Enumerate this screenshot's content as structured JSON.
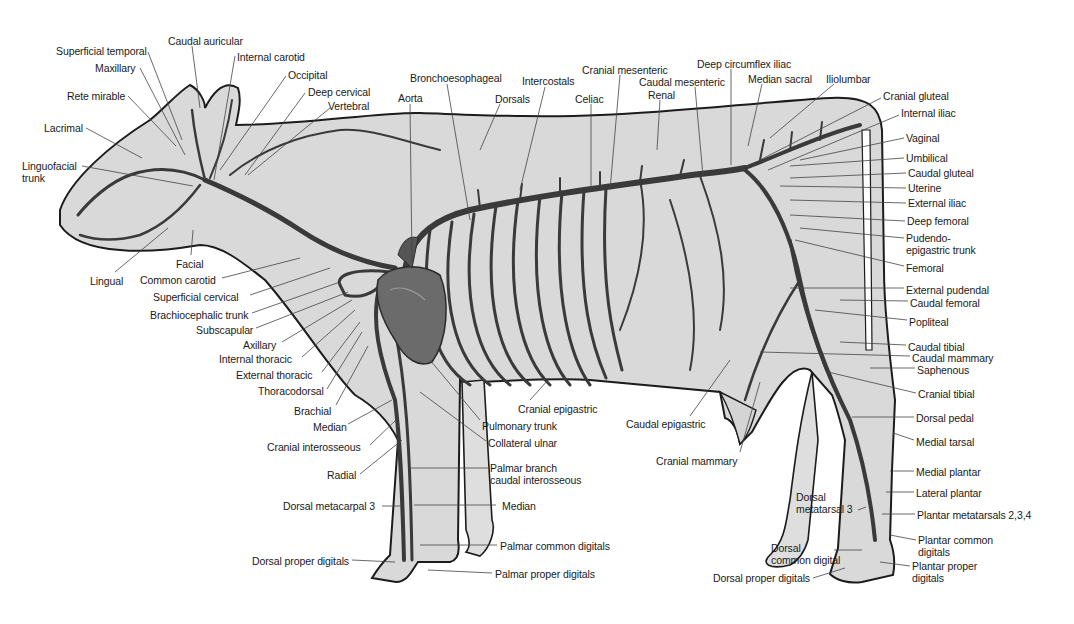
{
  "figure": {
    "colors": {
      "background": "#ffffff",
      "body_fill": "#d9d9d9",
      "outline": "#1c1c1c",
      "artery": "#3a3a3a",
      "leader": "#444444",
      "text": "#1a1a1a",
      "heart": "#6b6b6b"
    }
  },
  "labels": {
    "head": [
      {
        "text": "Superficial temporal",
        "x": 56,
        "y": 45,
        "align": "left",
        "lx1": 148,
        "ly1": 52,
        "lx2": 182,
        "ly2": 140
      },
      {
        "text": "Caudal auricular",
        "x": 168,
        "y": 35,
        "align": "left",
        "lx1": 192,
        "ly1": 46,
        "lx2": 200,
        "ly2": 108
      },
      {
        "text": "Internal carotid",
        "x": 237,
        "y": 51,
        "align": "left",
        "lx1": 235,
        "ly1": 56,
        "lx2": 214,
        "ly2": 180
      },
      {
        "text": "Maxillary",
        "x": 95,
        "y": 62,
        "align": "left",
        "lx1": 140,
        "ly1": 68,
        "lx2": 185,
        "ly2": 155
      },
      {
        "text": "Occipital",
        "x": 288,
        "y": 69,
        "align": "left",
        "lx1": 286,
        "ly1": 76,
        "lx2": 220,
        "ly2": 170
      },
      {
        "text": "Rete mirable",
        "x": 67,
        "y": 90,
        "align": "left",
        "lx1": 128,
        "ly1": 96,
        "lx2": 176,
        "ly2": 146
      },
      {
        "text": "Deep cervical",
        "x": 308,
        "y": 86,
        "align": "left",
        "lx1": 305,
        "ly1": 93,
        "lx2": 245,
        "ly2": 175
      },
      {
        "text": "Vertebral",
        "x": 328,
        "y": 100,
        "align": "left",
        "lx1": 330,
        "ly1": 108,
        "lx2": 248,
        "ly2": 175
      },
      {
        "text": "Lacrimal",
        "x": 44,
        "y": 122,
        "align": "left",
        "lx1": 86,
        "ly1": 128,
        "lx2": 142,
        "ly2": 158
      },
      {
        "text": "Linguofacial\ntrunk",
        "x": 22,
        "y": 160,
        "align": "left",
        "lx1": 82,
        "ly1": 166,
        "lx2": 193,
        "ly2": 186
      },
      {
        "text": "Facial",
        "x": 176,
        "y": 258,
        "align": "left",
        "lx1": 191,
        "ly1": 255,
        "lx2": 193,
        "ly2": 230
      },
      {
        "text": "Lingual",
        "x": 90,
        "y": 275,
        "align": "left",
        "lx1": 115,
        "ly1": 272,
        "lx2": 168,
        "ly2": 228
      }
    ],
    "neck_forelimb": [
      {
        "text": "Common carotid",
        "x": 140,
        "y": 274,
        "align": "left",
        "lx1": 222,
        "ly1": 278,
        "lx2": 300,
        "ly2": 258
      },
      {
        "text": "Superficial cervical",
        "x": 153,
        "y": 291,
        "align": "left",
        "lx1": 250,
        "ly1": 295,
        "lx2": 330,
        "ly2": 268
      },
      {
        "text": "Brachiocephalic trunk",
        "x": 150,
        "y": 309,
        "align": "left",
        "lx1": 252,
        "ly1": 313,
        "lx2": 340,
        "ly2": 282
      },
      {
        "text": "Subscapular",
        "x": 196,
        "y": 324,
        "align": "left",
        "lx1": 256,
        "ly1": 328,
        "lx2": 348,
        "ly2": 292
      },
      {
        "text": "Axillary",
        "x": 243,
        "y": 339,
        "align": "left",
        "lx1": 282,
        "ly1": 342,
        "lx2": 352,
        "ly2": 300
      },
      {
        "text": "Internal thoracic",
        "x": 219,
        "y": 353,
        "align": "left",
        "lx1": 302,
        "ly1": 357,
        "lx2": 355,
        "ly2": 310
      },
      {
        "text": "External thoracic",
        "x": 236,
        "y": 369,
        "align": "left",
        "lx1": 322,
        "ly1": 372,
        "lx2": 360,
        "ly2": 322
      },
      {
        "text": "Thoracodorsal",
        "x": 258,
        "y": 385,
        "align": "left",
        "lx1": 327,
        "ly1": 389,
        "lx2": 362,
        "ly2": 332
      },
      {
        "text": "Brachial",
        "x": 294,
        "y": 405,
        "align": "left",
        "lx1": 336,
        "ly1": 405,
        "lx2": 368,
        "ly2": 346
      },
      {
        "text": "Median",
        "x": 313,
        "y": 421,
        "align": "left",
        "lx1": 348,
        "ly1": 424,
        "lx2": 392,
        "ly2": 400
      },
      {
        "text": "Cranial interosseous",
        "x": 267,
        "y": 441,
        "align": "left",
        "lx1": 370,
        "ly1": 445,
        "lx2": 398,
        "ly2": 418
      },
      {
        "text": "Radial",
        "x": 327,
        "y": 469,
        "align": "left",
        "lx1": 360,
        "ly1": 474,
        "lx2": 402,
        "ly2": 440
      },
      {
        "text": "Dorsal metacarpal 3",
        "x": 283,
        "y": 500,
        "align": "left",
        "lx1": 382,
        "ly1": 506,
        "lx2": 404,
        "ly2": 506
      },
      {
        "text": "Dorsal proper digitals",
        "x": 252,
        "y": 555,
        "align": "left",
        "lx1": 352,
        "ly1": 560,
        "lx2": 395,
        "ly2": 562
      }
    ],
    "thorax_top": [
      {
        "text": "Aorta",
        "x": 398,
        "y": 92,
        "align": "left",
        "lx1": 410,
        "ly1": 104,
        "lx2": 412,
        "ly2": 262
      },
      {
        "text": "Bronchoesophageal",
        "x": 410,
        "y": 72,
        "align": "left",
        "lx1": 447,
        "ly1": 84,
        "lx2": 470,
        "ly2": 220
      },
      {
        "text": "Dorsals",
        "x": 495,
        "y": 93,
        "align": "left",
        "lx1": 500,
        "ly1": 104,
        "lx2": 480,
        "ly2": 150
      },
      {
        "text": "Intercostals",
        "x": 522,
        "y": 75,
        "align": "left",
        "lx1": 545,
        "ly1": 87,
        "lx2": 520,
        "ly2": 190
      },
      {
        "text": "Celiac",
        "x": 575,
        "y": 93,
        "align": "left",
        "lx1": 591,
        "ly1": 104,
        "lx2": 591,
        "ly2": 190
      },
      {
        "text": "Cranial mesenteric",
        "x": 582,
        "y": 64,
        "align": "left",
        "lx1": 620,
        "ly1": 75,
        "lx2": 610,
        "ly2": 190
      },
      {
        "text": "Caudal mesenteric",
        "x": 639,
        "y": 76,
        "align": "left",
        "lx1": 695,
        "ly1": 87,
        "lx2": 703,
        "ly2": 176
      },
      {
        "text": "Renal",
        "x": 648,
        "y": 89,
        "align": "left",
        "lx1": 660,
        "ly1": 100,
        "lx2": 657,
        "ly2": 150
      },
      {
        "text": "Deep circumflex iliac",
        "x": 697,
        "y": 58,
        "align": "left",
        "lx1": 731,
        "ly1": 69,
        "lx2": 731,
        "ly2": 165
      },
      {
        "text": "Median sacral",
        "x": 748,
        "y": 73,
        "align": "left",
        "lx1": 762,
        "ly1": 84,
        "lx2": 748,
        "ly2": 146
      },
      {
        "text": "Iliolumbar",
        "x": 826,
        "y": 73,
        "align": "left",
        "lx1": 834,
        "ly1": 84,
        "lx2": 770,
        "ly2": 138
      }
    ],
    "hindquarter_right": [
      {
        "text": "Cranial gluteal",
        "x": 883,
        "y": 90,
        "align": "left",
        "lx1": 881,
        "ly1": 98,
        "lx2": 760,
        "ly2": 160
      },
      {
        "text": "Internal iliac",
        "x": 901,
        "y": 107,
        "align": "left",
        "lx1": 899,
        "ly1": 115,
        "lx2": 768,
        "ly2": 170
      },
      {
        "text": "Vaginal",
        "x": 906,
        "y": 132,
        "align": "left",
        "lx1": 904,
        "ly1": 138,
        "lx2": 800,
        "ly2": 160
      },
      {
        "text": "Umbilical",
        "x": 906,
        "y": 152,
        "align": "left",
        "lx1": 904,
        "ly1": 158,
        "lx2": 790,
        "ly2": 166
      },
      {
        "text": "Caudal gluteal",
        "x": 908,
        "y": 167,
        "align": "left",
        "lx1": 906,
        "ly1": 173,
        "lx2": 790,
        "ly2": 178
      },
      {
        "text": "Uterine",
        "x": 908,
        "y": 182,
        "align": "left",
        "lx1": 906,
        "ly1": 188,
        "lx2": 780,
        "ly2": 186
      },
      {
        "text": "External iliac",
        "x": 908,
        "y": 197,
        "align": "left",
        "lx1": 906,
        "ly1": 203,
        "lx2": 790,
        "ly2": 200
      },
      {
        "text": "Deep femoral",
        "x": 907,
        "y": 215,
        "align": "left",
        "lx1": 905,
        "ly1": 221,
        "lx2": 790,
        "ly2": 215
      },
      {
        "text": "Pudendo-\nepigastric trunk",
        "x": 906,
        "y": 232,
        "align": "left",
        "lx1": 904,
        "ly1": 238,
        "lx2": 800,
        "ly2": 228
      },
      {
        "text": "Femoral",
        "x": 906,
        "y": 262,
        "align": "left",
        "lx1": 904,
        "ly1": 266,
        "lx2": 795,
        "ly2": 240
      },
      {
        "text": "External pudendal",
        "x": 906,
        "y": 284,
        "align": "left",
        "lx1": 904,
        "ly1": 288,
        "lx2": 790,
        "ly2": 288
      },
      {
        "text": "Caudal femoral",
        "x": 910,
        "y": 297,
        "align": "left",
        "lx1": 908,
        "ly1": 301,
        "lx2": 840,
        "ly2": 300
      },
      {
        "text": "Popliteal",
        "x": 909,
        "y": 316,
        "align": "left",
        "lx1": 907,
        "ly1": 320,
        "lx2": 815,
        "ly2": 310
      },
      {
        "text": "Caudal tibial",
        "x": 908,
        "y": 341,
        "align": "left",
        "lx1": 906,
        "ly1": 345,
        "lx2": 840,
        "ly2": 342
      },
      {
        "text": "Caudal mammary",
        "x": 912,
        "y": 352,
        "align": "left",
        "lx1": 910,
        "ly1": 356,
        "lx2": 760,
        "ly2": 352
      },
      {
        "text": "Saphenous",
        "x": 917,
        "y": 364,
        "align": "left",
        "lx1": 915,
        "ly1": 368,
        "lx2": 870,
        "ly2": 368
      },
      {
        "text": "Cranial tibial",
        "x": 918,
        "y": 388,
        "align": "left",
        "lx1": 916,
        "ly1": 393,
        "lx2": 828,
        "ly2": 372
      },
      {
        "text": "Dorsal pedal",
        "x": 916,
        "y": 412,
        "align": "left",
        "lx1": 914,
        "ly1": 417,
        "lx2": 852,
        "ly2": 417
      },
      {
        "text": "Medial tarsal",
        "x": 916,
        "y": 436,
        "align": "left",
        "lx1": 914,
        "ly1": 440,
        "lx2": 893,
        "ly2": 433
      },
      {
        "text": "Medial plantar",
        "x": 916,
        "y": 466,
        "align": "left",
        "lx1": 914,
        "ly1": 471,
        "lx2": 890,
        "ly2": 471
      },
      {
        "text": "Lateral plantar",
        "x": 916,
        "y": 487,
        "align": "left",
        "lx1": 914,
        "ly1": 492,
        "lx2": 886,
        "ly2": 492
      },
      {
        "text": "Plantar metatarsals 2,3,4",
        "x": 917,
        "y": 509,
        "align": "left",
        "lx1": 915,
        "ly1": 514,
        "lx2": 882,
        "ly2": 514
      },
      {
        "text": "Plantar common\ndigitals",
        "x": 918,
        "y": 534,
        "align": "left",
        "lx1": 916,
        "ly1": 540,
        "lx2": 890,
        "ly2": 535
      },
      {
        "text": "Plantar proper\ndigitals",
        "x": 912,
        "y": 560,
        "align": "left",
        "lx1": 910,
        "ly1": 566,
        "lx2": 880,
        "ly2": 562
      }
    ],
    "ventral_lower": [
      {
        "text": "Cranial epigastric",
        "x": 518,
        "y": 403,
        "align": "left",
        "lx1": 530,
        "ly1": 400,
        "lx2": 548,
        "ly2": 380
      },
      {
        "text": "Pulmonary trunk",
        "x": 482,
        "y": 420,
        "align": "left",
        "lx1": 480,
        "ly1": 420,
        "lx2": 430,
        "ly2": 360
      },
      {
        "text": "Collateral ulnar",
        "x": 488,
        "y": 437,
        "align": "left",
        "lx1": 486,
        "ly1": 441,
        "lx2": 420,
        "ly2": 392
      },
      {
        "text": "Palmar branch\ncaudal interosseous",
        "x": 490,
        "y": 462,
        "align": "left",
        "lx1": 488,
        "ly1": 468,
        "lx2": 410,
        "ly2": 468
      },
      {
        "text": "Median",
        "x": 502,
        "y": 500,
        "align": "left",
        "lx1": 496,
        "ly1": 505,
        "lx2": 414,
        "ly2": 505
      },
      {
        "text": "Palmar common digitals",
        "x": 500,
        "y": 540,
        "align": "left",
        "lx1": 497,
        "ly1": 545,
        "lx2": 420,
        "ly2": 545
      },
      {
        "text": "Palmar proper digitals",
        "x": 495,
        "y": 568,
        "align": "left",
        "lx1": 492,
        "ly1": 573,
        "lx2": 428,
        "ly2": 570
      },
      {
        "text": "Caudal epigastric",
        "x": 626,
        "y": 418,
        "align": "left",
        "lx1": 690,
        "ly1": 416,
        "lx2": 730,
        "ly2": 360
      },
      {
        "text": "Cranial mammary",
        "x": 656,
        "y": 455,
        "align": "left",
        "lx1": 740,
        "ly1": 452,
        "lx2": 760,
        "ly2": 382
      }
    ],
    "hind_foot_left": [
      {
        "text": "Dorsal\nmetatarsal 3",
        "x": 796,
        "y": 491,
        "align": "left",
        "lx1": 858,
        "ly1": 510,
        "lx2": 866,
        "ly2": 507
      },
      {
        "text": "Dorsal\ncommon digital",
        "x": 771,
        "y": 542,
        "align": "left",
        "lx1": 834,
        "ly1": 550,
        "lx2": 862,
        "ly2": 550
      },
      {
        "text": "Dorsal proper digitals",
        "x": 713,
        "y": 572,
        "align": "left",
        "lx1": 813,
        "ly1": 578,
        "lx2": 845,
        "ly2": 568
      }
    ]
  }
}
